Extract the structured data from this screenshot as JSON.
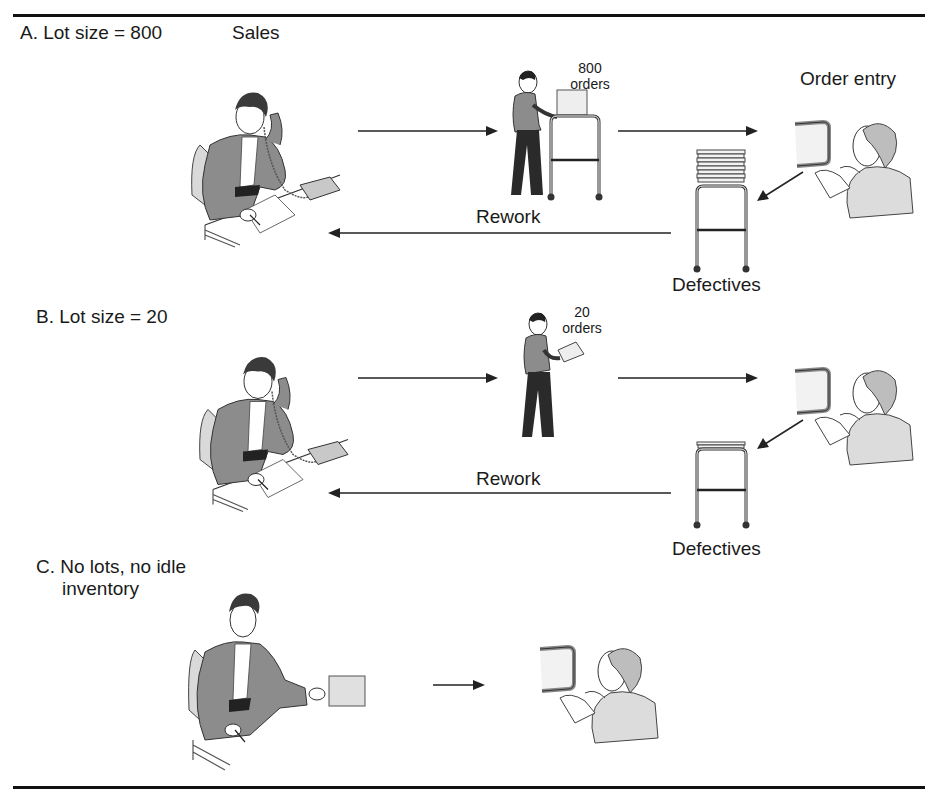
{
  "exhibit": {
    "header_title": "",
    "sections": [
      {
        "id": "A",
        "title": "A. Lot size = 800",
        "sales_label": "Sales",
        "order_entry_label": "Order entry",
        "batch_count": "800",
        "batch_unit": "orders",
        "rework_label": "Rework",
        "defectives_label": "Defectives"
      },
      {
        "id": "B",
        "title": "B. Lot size = 20",
        "batch_count": "20",
        "batch_unit": "orders",
        "rework_label": "Rework",
        "defectives_label": "Defectives"
      },
      {
        "id": "C",
        "title_line1": "C. No lots, no idle",
        "title_line2": "inventory"
      }
    ]
  },
  "colors": {
    "ink": "#1a1a1a",
    "suit_gray": "#8c8c8c",
    "light_gray": "#d9d9d9",
    "paper": "#e6e6e6",
    "rule": "#111111"
  }
}
